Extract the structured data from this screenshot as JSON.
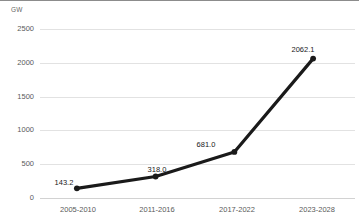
{
  "chart_data": {
    "type": "line",
    "title": "",
    "subtitle": "",
    "xlabel": "",
    "ylabel": "GW",
    "unit_label": "GW",
    "categories": [
      "2005-2010",
      "2011-2016",
      "2017-2022",
      "2023-2028"
    ],
    "values": [
      143.2,
      318.0,
      681.0,
      2062.1
    ],
    "point_labels": [
      "143.2",
      "318.0",
      "681.0",
      "2062.1"
    ],
    "series": [
      {
        "name": "Capacity",
        "values": [
          143.2,
          318.0,
          681.0,
          2062.1
        ]
      }
    ],
    "ylim": [
      0,
      2500
    ],
    "yticks": [
      2500,
      2000,
      1500,
      1000,
      500,
      0
    ],
    "ytick_labels": [
      "2500",
      "2000",
      "1500",
      "1000",
      "500",
      "0"
    ],
    "grid": true,
    "grid_axis": "y",
    "legend": false,
    "legend_position": "none",
    "colors": {
      "line": "#1a1a1a",
      "marker": "#1a1a1a",
      "grid": "#e2e2e2",
      "axis": "#d2d2d2",
      "tick_text": "#5a5a5a",
      "label_text": "#1a1a1a",
      "background": "#ffffff",
      "top_rule": "#8c8c8c"
    }
  }
}
